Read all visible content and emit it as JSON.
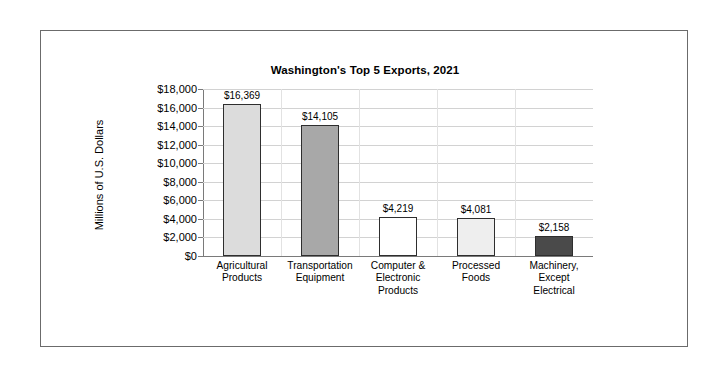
{
  "chart_data": {
    "type": "bar",
    "title": "Washington's Top 5 Exports, 2021",
    "xlabel": "",
    "ylabel": "Millions of U.S. Dollars",
    "ylim": [
      0,
      18000
    ],
    "ytick_step": 2000,
    "grid": true,
    "legend": "none",
    "categories": [
      "Agricultural\nProducts",
      "Transportation\nEquipment",
      "Computer &\nElectronic\nProducts",
      "Processed\nFoods",
      "Machinery,\nExcept\nElectrical"
    ],
    "category_lines": [
      [
        "Agricultural",
        "Products"
      ],
      [
        "Transportation",
        "Equipment"
      ],
      [
        "Computer &",
        "Electronic",
        "Products"
      ],
      [
        "Processed",
        "Foods"
      ],
      [
        "Machinery,",
        "Except",
        "Electrical"
      ]
    ],
    "values": [
      16369,
      14105,
      4219,
      4081,
      2158
    ],
    "value_labels": [
      "$16,369",
      "$14,105",
      "$4,219",
      "$4,081",
      "$2,158"
    ],
    "bar_colors": [
      "#dcdcdc",
      "#a8a8a8",
      "#ffffff",
      "#eeeeee",
      "#4a4a4a"
    ],
    "bar_border_color": "#2e2e2e",
    "ytick_labels": [
      "$18,000",
      "$16,000",
      "$14,000",
      "$12,000",
      "$10,000",
      "$8,000",
      "$6,000",
      "$4,000",
      "$2,000",
      "$0"
    ],
    "ytick_values": [
      18000,
      16000,
      14000,
      12000,
      10000,
      8000,
      6000,
      4000,
      2000,
      0
    ],
    "frame_color": "#6b6b6b",
    "gridline_color": "#d2d2d2",
    "axis_color": "#7a7a7a",
    "background": "#ffffff"
  }
}
